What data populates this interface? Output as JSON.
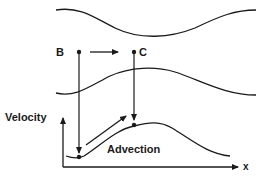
{
  "diagram": {
    "labels": {
      "point_b": "B",
      "point_c": "C",
      "y_axis": "Velocity",
      "x_axis": "x",
      "process": "Advection"
    },
    "colors": {
      "stroke": "#1a1a1a",
      "background": "#ffffff"
    }
  }
}
